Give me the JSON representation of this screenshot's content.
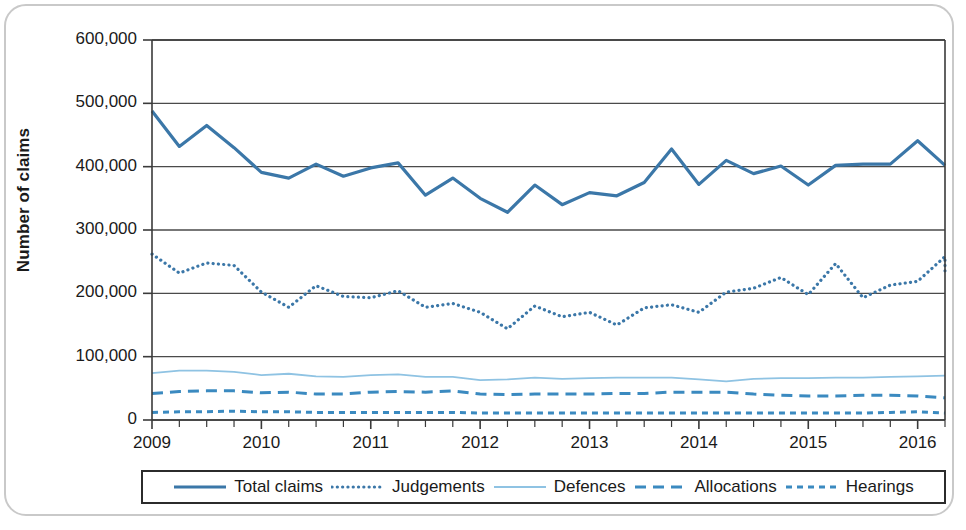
{
  "figure": {
    "y_axis_title": "Number of claims",
    "frame_color": "#c9c9c9"
  },
  "colors": {
    "total_claims": "#3b77a8",
    "judgements": "#3b77a8",
    "defences": "#8fc3e3",
    "allocations": "#3b8ac0",
    "hearings": "#3b8ac0",
    "axis": "#3a3a3a",
    "gridline": "#4a4a4a",
    "text": "#1a1a1a"
  },
  "chart_data": {
    "type": "line",
    "title": "",
    "xlabel": "",
    "ylabel": "Number of claims",
    "ylim": [
      0,
      600000
    ],
    "ytick_labels": [
      "0",
      "100,000",
      "200,000",
      "300,000",
      "400,000",
      "500,000",
      "600,000"
    ],
    "ytick_values": [
      0,
      100000,
      200000,
      300000,
      400000,
      500000,
      600000
    ],
    "grid": true,
    "legend_position": "bottom",
    "xtick_labels": [
      "2009",
      "2010",
      "2011",
      "2012",
      "2013",
      "2014",
      "2015",
      "2016"
    ],
    "x_minor_ticks_per_year": 4,
    "x_note": "quarterly data points, Q1 2009 through Q2 2016",
    "x": [
      "2009 Q1",
      "2009 Q2",
      "2009 Q3",
      "2009 Q4",
      "2010 Q1",
      "2010 Q2",
      "2010 Q3",
      "2010 Q4",
      "2011 Q1",
      "2011 Q2",
      "2011 Q3",
      "2011 Q4",
      "2012 Q1",
      "2012 Q2",
      "2012 Q3",
      "2012 Q4",
      "2013 Q1",
      "2013 Q2",
      "2013 Q3",
      "2013 Q4",
      "2014 Q1",
      "2014 Q2",
      "2014 Q3",
      "2014 Q4",
      "2015 Q1",
      "2015 Q2",
      "2015 Q3",
      "2015 Q4",
      "2016 Q1",
      "2016 Q2"
    ],
    "series": [
      {
        "name": "Total claims",
        "style": "solid",
        "width": 3.2,
        "color": "#3b77a8",
        "values": [
          488000,
          432000,
          465000,
          430000,
          391000,
          382000,
          404000,
          385000,
          398000,
          406000,
          355000,
          382000,
          350000,
          328000,
          371000,
          340000,
          359000,
          354000,
          375000,
          428000,
          372000,
          410000,
          389000,
          401000,
          371000,
          402000,
          404000,
          404000,
          441000,
          402000
        ]
      },
      {
        "name": "Judgements",
        "style": "dotted",
        "width": 3.2,
        "color": "#3b77a8",
        "values": [
          262000,
          232000,
          248000,
          244000,
          202000,
          178000,
          212000,
          195000,
          193000,
          204000,
          178000,
          184000,
          170000,
          144000,
          180000,
          163000,
          170000,
          150000,
          177000,
          182000,
          170000,
          202000,
          208000,
          225000,
          198000,
          247000,
          193000,
          213000,
          219000,
          258000
        ],
        "values_tail": 228000
      },
      {
        "name": "Defences",
        "style": "solid-thin",
        "width": 1.8,
        "color": "#8fc3e3",
        "values": [
          74000,
          78000,
          78000,
          76000,
          71000,
          73000,
          69000,
          68000,
          71000,
          72000,
          68000,
          68000,
          63000,
          64000,
          67000,
          65000,
          66000,
          67000,
          67000,
          67000,
          64000,
          61000,
          65000,
          66000,
          66000,
          67000,
          67000,
          68000,
          69000,
          70000
        ]
      },
      {
        "name": "Allocations",
        "style": "dashed",
        "width": 3.0,
        "color": "#3b8ac0",
        "values": [
          42000,
          45000,
          46000,
          46000,
          43000,
          44000,
          41000,
          41000,
          44000,
          45000,
          44000,
          46000,
          41000,
          40000,
          41000,
          41000,
          41000,
          42000,
          42000,
          44000,
          44000,
          44000,
          41000,
          39000,
          38000,
          38000,
          39000,
          39000,
          38000,
          35000
        ]
      },
      {
        "name": "Hearings",
        "style": "dashed-fine",
        "width": 3.0,
        "color": "#3b8ac0",
        "values": [
          12000,
          13000,
          13000,
          14000,
          13000,
          13000,
          12000,
          12000,
          12000,
          12000,
          12000,
          12000,
          11000,
          11000,
          11000,
          11000,
          11000,
          11000,
          11000,
          11000,
          11000,
          11000,
          11000,
          11000,
          11000,
          11000,
          11000,
          12000,
          13000,
          11000
        ]
      }
    ]
  },
  "legend": {
    "items": [
      {
        "label": "Total claims",
        "style": "solid",
        "color": "#3b77a8"
      },
      {
        "label": "Judgements",
        "style": "dotted",
        "color": "#3b77a8"
      },
      {
        "label": "Defences",
        "style": "solid-thin",
        "color": "#8fc3e3"
      },
      {
        "label": "Allocations",
        "style": "dashed",
        "color": "#3b8ac0"
      },
      {
        "label": "Hearings",
        "style": "dashed-fine",
        "color": "#3b8ac0"
      }
    ]
  }
}
